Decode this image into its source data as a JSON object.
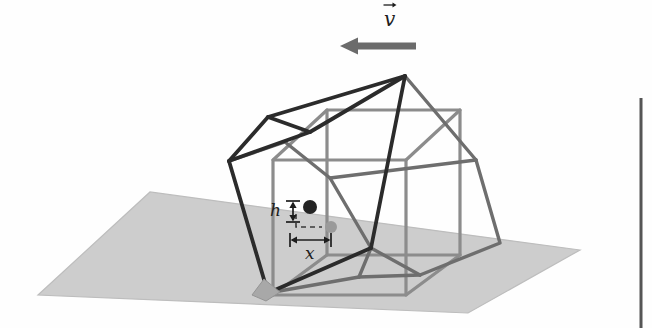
{
  "figure": {
    "kind": "physics-diagram",
    "background_color": "#fefefe"
  },
  "labels": {
    "velocity": "v",
    "velocity_accent": "vector-arrow",
    "height_offset": "h",
    "horizontal_offset": "x"
  },
  "colors": {
    "ground_fill": "#cdcdcd",
    "ground_stroke": "#b4b4b4",
    "ground_shadow": "#a8a8a8",
    "upright_cube_stroke": "#8c8c8c",
    "tilted_cube_stroke_front": "#2b2b2b",
    "tilted_cube_stroke_back": "#6e6e6e",
    "arrow_fill": "#6b6b6b",
    "dot_dark": "#242424",
    "dot_gray": "#9a9a9a",
    "dimension_stroke": "#1d1d1d",
    "page_rule": "#555555"
  },
  "geometry": {
    "ground_plane": [
      [
        38,
        295
      ],
      [
        150,
        192
      ],
      [
        580,
        250
      ],
      [
        468,
        313
      ]
    ],
    "pivot_wedge": [
      [
        266,
        281
      ],
      [
        281,
        292
      ],
      [
        266,
        300
      ],
      [
        252,
        294
      ]
    ],
    "upright_cube": {
      "front_bottom_left": [
        273,
        295
      ],
      "front_bottom_right": [
        406,
        295
      ],
      "front_top_left": [
        273,
        160
      ],
      "front_top_right": [
        406,
        160
      ],
      "back_bottom_left": [
        327,
        255
      ],
      "back_bottom_right": [
        460,
        255
      ],
      "back_top_left": [
        327,
        110
      ],
      "back_top_right": [
        460,
        110
      ]
    },
    "tilted_cube": {
      "pivot": [
        268,
        293
      ],
      "left": [
        229,
        161
      ],
      "apex": [
        405,
        76
      ],
      "near_right": [
        371,
        248
      ],
      "far_low": [
        359,
        277
      ]
    },
    "velocity_arrow": {
      "tail_x": 416,
      "head_x": 340,
      "y": 46,
      "shaft_height": 7,
      "head_width": 16,
      "head_height": 17
    },
    "dimension_h": {
      "x": 293,
      "y_top": 201,
      "y_bottom": 222
    },
    "dimension_x": {
      "y": 240,
      "x_left": 290,
      "x_right": 331
    },
    "com_dark_dot": {
      "cx": 310,
      "cy": 207,
      "r": 7
    },
    "com_gray_dot": {
      "cx": 331,
      "cy": 227,
      "r": 6
    },
    "connector_path": "M 294 216 L 294 227 L 322 227",
    "page_rule": {
      "x": 641,
      "y_top": 98,
      "y_bottom": 328
    }
  },
  "annotations": {
    "velocity_arrow_name": "velocity-arrow",
    "height_dimension_name": "height-dimension",
    "width_dimension_name": "horizontal-dimension"
  }
}
